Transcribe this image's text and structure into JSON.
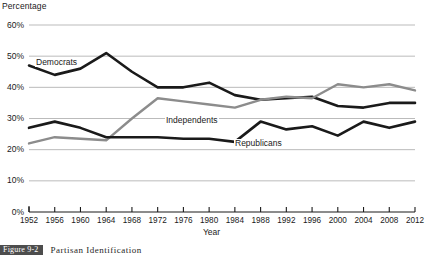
{
  "chart_data": {
    "type": "line",
    "title": "Partisan Identification",
    "xlabel": "Year",
    "ylabel": "Percentage",
    "grid": true,
    "legend_position": "inline-labels",
    "xlim": [
      1952,
      2012
    ],
    "ylim": [
      0,
      60
    ],
    "y_ticks": [
      0,
      10,
      20,
      30,
      40,
      50,
      60
    ],
    "y_tick_labels": [
      "0%",
      "10%",
      "20%",
      "30%",
      "40%",
      "50%",
      "60%"
    ],
    "x_ticks": [
      1952,
      1956,
      1960,
      1964,
      1968,
      1972,
      1976,
      1980,
      1984,
      1988,
      1992,
      1996,
      2000,
      2004,
      2008,
      2012
    ],
    "x_tick_labels": [
      "1952",
      "1956",
      "1960",
      "1964",
      "1968",
      "1972",
      "1976",
      "1980",
      "1984",
      "1988",
      "1992",
      "1996",
      "2000",
      "2004",
      "2008",
      "2012"
    ],
    "x": [
      1952,
      1956,
      1960,
      1964,
      1968,
      1972,
      1976,
      1980,
      1984,
      1988,
      1992,
      1996,
      2000,
      2004,
      2008,
      2012
    ],
    "series": [
      {
        "name": "Democrats",
        "color": "#1a1a1a",
        "width": 2.6,
        "values": [
          47,
          44,
          46,
          51,
          45,
          40,
          40,
          41.5,
          37.5,
          36,
          36.5,
          37,
          34,
          33.5,
          35,
          35
        ]
      },
      {
        "name": "Independents",
        "color": "#8c8c8c",
        "width": 2.4,
        "values": [
          22,
          24,
          23.5,
          23,
          30,
          36.5,
          35.5,
          34.5,
          33.5,
          36,
          37,
          36.5,
          41,
          40,
          41,
          39
        ]
      },
      {
        "name": "Republicans",
        "color": "#1a1a1a",
        "width": 2.6,
        "values": [
          27,
          29,
          27,
          24,
          24,
          24,
          23.5,
          23.5,
          22.5,
          29,
          26.5,
          27.5,
          24.5,
          29,
          27,
          29
        ]
      }
    ]
  },
  "caption": {
    "figure_number": "Figure 9-2",
    "title": "Partisan Identification"
  },
  "colors": {
    "gridline": "#b3b3b3",
    "axis": "#1a1a1a",
    "democrats": "#1a1a1a",
    "independents": "#8c8c8c",
    "republicans": "#1a1a1a",
    "caption_badge_bg": "#4d4d4d"
  }
}
